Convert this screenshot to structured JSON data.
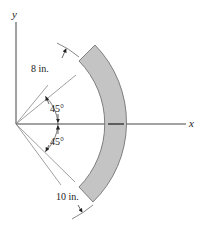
{
  "figure": {
    "axes": {
      "x_label": "x",
      "y_label": "y"
    },
    "angles": [
      {
        "label": "45°",
        "position": "above x-axis"
      },
      {
        "label": "45°",
        "position": "below x-axis"
      }
    ],
    "dimensions": {
      "inner_radius_label": "8 in.",
      "outer_radius_label": "10 in."
    },
    "member": {
      "shape": "circular arc segment",
      "fill": "#c4c4c4",
      "stroke": "#555555"
    }
  }
}
